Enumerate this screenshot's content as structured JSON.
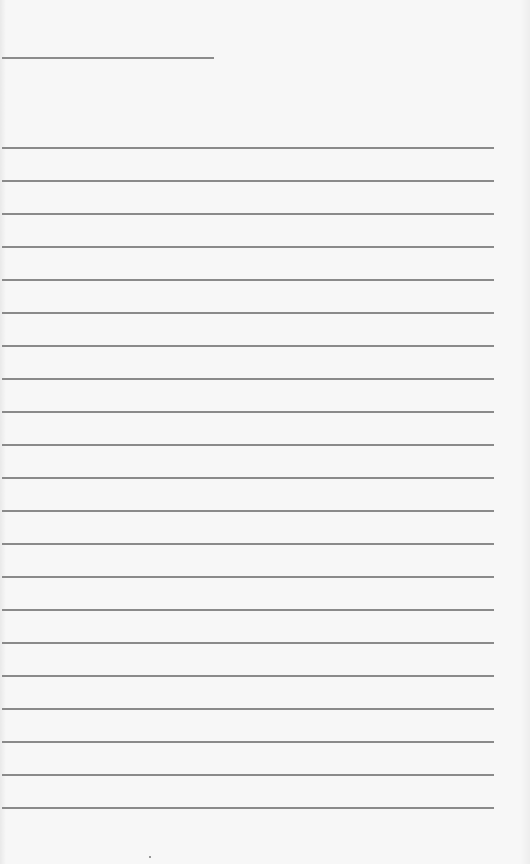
{
  "page": {
    "type": "lined-notebook-page",
    "background_color": "#f7f7f7",
    "line_color": "#8a8a8a",
    "header_line": {
      "x": 2,
      "y": 57,
      "width": 212
    },
    "rules": {
      "count": 21,
      "start_y": 147,
      "spacing": 33,
      "x": 2,
      "width": 492
    },
    "text": []
  }
}
